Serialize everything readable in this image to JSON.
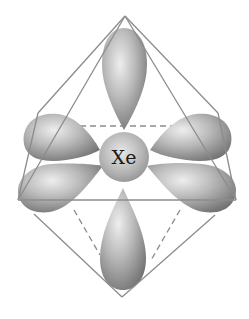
{
  "diagram": {
    "type": "orbital-geometry",
    "shape": "octahedron",
    "center_atom": {
      "label": "Xe"
    },
    "lobes": [
      {
        "name": "lobe-top",
        "direction": "up"
      },
      {
        "name": "lobe-bottom",
        "direction": "down"
      },
      {
        "name": "lobe-upper-left",
        "direction": "left-back"
      },
      {
        "name": "lobe-lower-left",
        "direction": "left-front"
      },
      {
        "name": "lobe-upper-right",
        "direction": "right-back"
      },
      {
        "name": "lobe-lower-right",
        "direction": "right-front"
      }
    ],
    "colors": {
      "lobe_light": "#d9d9d9",
      "lobe_dark": "#7a7a7a",
      "edge": "#8c8c8c",
      "background": "#ffffff"
    }
  }
}
